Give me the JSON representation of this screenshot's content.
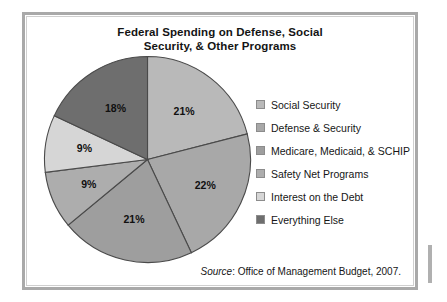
{
  "figure": {
    "title_line_1": "Federal Spending on Defense, Social",
    "title_line_2": "Security, & Other Programs",
    "source_prefix": "Source",
    "source_text": ": Office of Management Budget, 2007."
  },
  "legend": {
    "items": [
      {
        "label": "Social Security",
        "color": "#b9b9b9"
      },
      {
        "label": "Defense & Security",
        "color": "#a8a8a8"
      },
      {
        "label": "Medicare, Medicaid, & SCHIP",
        "color": "#9e9e9e"
      },
      {
        "label": "Safety Net Programs",
        "color": "#adadad"
      },
      {
        "label": "Interest on the Debt",
        "color": "#d6d6d6"
      },
      {
        "label": "Everything Else",
        "color": "#6e6e6e"
      }
    ]
  },
  "chart_data": {
    "type": "pie",
    "title": "Federal Spending on Defense, Social Security, & Other Programs",
    "xlabel": "",
    "ylabel": "",
    "units": "percent",
    "start_angle_deg": 0,
    "direction": "clockwise",
    "legend_position": "right",
    "grid": false,
    "categories": [
      "Social Security",
      "Defense & Security",
      "Medicare, Medicaid, & SCHIP",
      "Safety Net Programs",
      "Interest on the Debt",
      "Everything Else"
    ],
    "values": [
      21,
      22,
      21,
      9,
      9,
      18
    ],
    "labels": [
      "21%",
      "22%",
      "21%",
      "9%",
      "9%",
      "18%"
    ],
    "colors": [
      "#b9b9b9",
      "#a8a8a8",
      "#9e9e9e",
      "#adadad",
      "#d6d6d6",
      "#6e6e6e"
    ],
    "annotations": [
      "Source: Office of Management Budget, 2007."
    ]
  }
}
